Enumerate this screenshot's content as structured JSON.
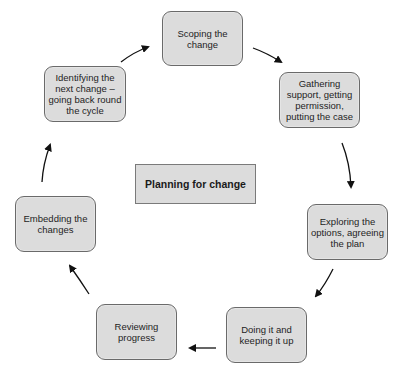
{
  "diagram": {
    "title": "Planning for change",
    "type": "cycle",
    "colors": {
      "node_fill": "#dcdcdc",
      "node_border": "#6a6a6a",
      "arrow": "#111111",
      "background": "#ffffff"
    },
    "nodes": [
      {
        "id": "scoping",
        "label": "Scoping the\nchange"
      },
      {
        "id": "gathering",
        "label": "Gathering\nsupport, getting\npermission,\nputting the case"
      },
      {
        "id": "exploring",
        "label": "Exploring the\noptions, agreeing\nthe plan"
      },
      {
        "id": "doing",
        "label": "Doing it and\nkeeping it up"
      },
      {
        "id": "reviewing",
        "label": "Reviewing\nprogress"
      },
      {
        "id": "embedding",
        "label": "Embedding the\nchanges"
      },
      {
        "id": "identifying",
        "label": "Identifying the\nnext change –\ngoing back round\nthe cycle"
      }
    ],
    "edges": [
      {
        "from": "scoping",
        "to": "gathering"
      },
      {
        "from": "gathering",
        "to": "exploring"
      },
      {
        "from": "exploring",
        "to": "doing"
      },
      {
        "from": "doing",
        "to": "reviewing"
      },
      {
        "from": "reviewing",
        "to": "embedding"
      },
      {
        "from": "embedding",
        "to": "identifying"
      },
      {
        "from": "identifying",
        "to": "scoping"
      }
    ]
  }
}
